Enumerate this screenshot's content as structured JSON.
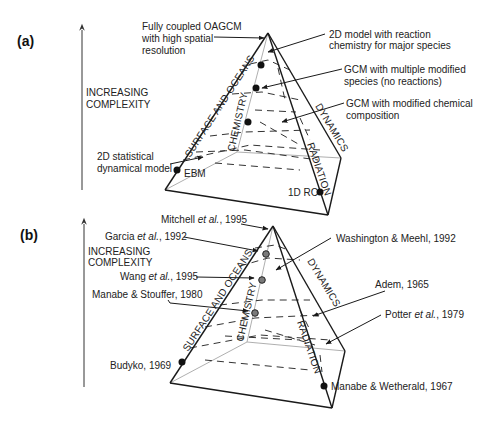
{
  "panels": [
    {
      "id": "a",
      "label": "(a)",
      "axis_label_line1": "INCREASING",
      "axis_label_line2": "COMPLEXITY",
      "faces": {
        "surface": "SURFACE AND OCEANS",
        "chemistry": "CHEMISTRY",
        "dynamics": "DYNAMICS",
        "radiation": "RADIATION"
      },
      "annotations": {
        "oagcm_1": "Fully coupled OAGCM",
        "oagcm_2": "with high spatial",
        "oagcm_3": "resolution",
        "twod_chem_1": "2D model with reaction",
        "twod_chem_2": "chemistry for major species",
        "gcm_multi_1": "GCM with multiple modified",
        "gcm_multi_2": "species (no reactions)",
        "gcm_mod_1": "GCM with modified chemical",
        "gcm_mod_2": "composition",
        "twod_stat_1": "2D statistical",
        "twod_stat_2": "dynamical model",
        "ebm": "EBM",
        "rc1d": "1D RC"
      }
    },
    {
      "id": "b",
      "label": "(b)",
      "axis_label_line1": "INCREASING",
      "axis_label_line2": "COMPLEXITY",
      "faces": {
        "surface": "SURFACE AND OCEANS",
        "chemistry": "CHEMISTRY",
        "dynamics": "DYNAMICS",
        "radiation": "RADIATION"
      },
      "annotations": {
        "mitchell_name": "Mitchell ",
        "mitchell_etal": "et al.",
        "mitchell_year": ", 1995",
        "garcia_name": "Garcia ",
        "garcia_etal": "et al.",
        "garcia_year": ", 1992",
        "wang_name": "Wang ",
        "wang_etal": "et al.",
        "wang_year": ", 1995",
        "manabe_stouffer": "Manabe & Stouffer, 1980",
        "budyko": "Budyko, 1969",
        "washington": "Washington & Meehl, 1992",
        "adem": "Adem, 1965",
        "potter_name": "Potter ",
        "potter_etal": "et al.",
        "potter_year": ", 1979",
        "manabe_wetherald": "Manabe & Wetherald, 1967"
      }
    }
  ],
  "colors": {
    "line": "#1a1a1a",
    "hidden_edge": "#9a9a9a",
    "dot_a": "#111111",
    "dot_b_fill": "#7a7a7a"
  }
}
